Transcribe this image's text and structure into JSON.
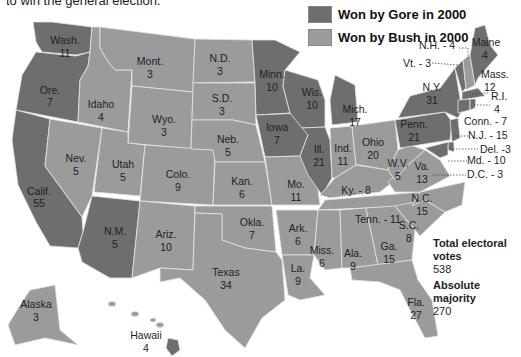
{
  "intro_text": "to win the general election.",
  "legend": {
    "items": [
      {
        "label": "Won by Gore in 2000",
        "color": "#6e6e6e"
      },
      {
        "label": "Won by Bush in 2000",
        "color": "#9b9b9b"
      }
    ]
  },
  "totals": {
    "total_label_line1": "Total electoral",
    "total_label_line2": "votes",
    "total_value": "538",
    "majority_label": "Absolute majority",
    "majority_value": "270"
  },
  "states": {
    "wash": {
      "name": "Wash.",
      "votes": "11",
      "winner": "Gore"
    },
    "ore": {
      "name": "Ore.",
      "votes": "7",
      "winner": "Gore"
    },
    "calif": {
      "name": "Calif.",
      "votes": "55",
      "winner": "Gore"
    },
    "idaho": {
      "name": "Idaho",
      "votes": "4",
      "winner": "Bush"
    },
    "nev": {
      "name": "Nev.",
      "votes": "5",
      "winner": "Bush"
    },
    "mont": {
      "name": "Mont.",
      "votes": "3",
      "winner": "Bush"
    },
    "wyo": {
      "name": "Wyo.",
      "votes": "3",
      "winner": "Bush"
    },
    "utah": {
      "name": "Utah",
      "votes": "5",
      "winner": "Bush"
    },
    "colo": {
      "name": "Colo.",
      "votes": "9",
      "winner": "Bush"
    },
    "nm": {
      "name": "N.M.",
      "votes": "5",
      "winner": "Gore"
    },
    "ariz": {
      "name": "Ariz.",
      "votes": "10",
      "winner": "Bush"
    },
    "nd": {
      "name": "N.D.",
      "votes": "3",
      "winner": "Bush"
    },
    "sd": {
      "name": "S.D.",
      "votes": "3",
      "winner": "Bush"
    },
    "neb": {
      "name": "Neb.",
      "votes": "5",
      "winner": "Bush"
    },
    "kan": {
      "name": "Kan.",
      "votes": "6",
      "winner": "Bush"
    },
    "okla": {
      "name": "Okla.",
      "votes": "7",
      "winner": "Bush"
    },
    "texas": {
      "name": "Texas",
      "votes": "34",
      "winner": "Bush"
    },
    "minn": {
      "name": "Minn.",
      "votes": "10",
      "winner": "Gore"
    },
    "iowa": {
      "name": "Iowa",
      "votes": "7",
      "winner": "Gore"
    },
    "mo": {
      "name": "Mo.",
      "votes": "11",
      "winner": "Bush"
    },
    "ark": {
      "name": "Ark.",
      "votes": "6",
      "winner": "Bush"
    },
    "la": {
      "name": "La.",
      "votes": "9",
      "winner": "Bush"
    },
    "wis": {
      "name": "Wis.",
      "votes": "10",
      "winner": "Gore"
    },
    "ill": {
      "name": "Ill.",
      "votes": "21",
      "winner": "Gore"
    },
    "mich": {
      "name": "Mich.",
      "votes": "17",
      "winner": "Gore"
    },
    "ind": {
      "name": "Ind.",
      "votes": "11",
      "winner": "Bush"
    },
    "ohio": {
      "name": "Ohio",
      "votes": "20",
      "winner": "Bush"
    },
    "ky": {
      "name": "Ky. - 8",
      "votes": "8",
      "winner": "Bush"
    },
    "tenn": {
      "name": "Tenn. - 11",
      "votes": "11",
      "winner": "Bush"
    },
    "miss": {
      "name": "Miss.",
      "votes": "6",
      "winner": "Bush"
    },
    "ala": {
      "name": "Ala.",
      "votes": "9",
      "winner": "Bush"
    },
    "ga": {
      "name": "Ga.",
      "votes": "15",
      "winner": "Bush"
    },
    "fla": {
      "name": "Fla.",
      "votes": "27",
      "winner": "Bush"
    },
    "sc": {
      "name": "S.C.",
      "votes": "8",
      "winner": "Bush"
    },
    "nc": {
      "name": "N.C.",
      "votes": "15",
      "winner": "Bush"
    },
    "va": {
      "name": "Va.",
      "votes": "13",
      "winner": "Bush"
    },
    "wv": {
      "name": "W.V.",
      "votes": "5",
      "winner": "Bush"
    },
    "penn": {
      "name": "Penn.",
      "votes": "21",
      "winner": "Gore"
    },
    "ny": {
      "name": "N.Y.",
      "votes": "31",
      "winner": "Gore"
    },
    "maine": {
      "name": "Maine",
      "votes": "4",
      "winner": "Gore"
    },
    "nh": {
      "name": "N.H. - 4",
      "votes": "4",
      "winner": "Bush"
    },
    "vt": {
      "name": "Vt. - 3",
      "votes": "3",
      "winner": "Gore"
    },
    "mass": {
      "name": "Mass.",
      "votes": "12",
      "winner": "Gore"
    },
    "ri": {
      "name": "R.I.",
      "votes": "4",
      "winner": "Gore"
    },
    "conn": {
      "name": "Conn. - 7",
      "votes": "7",
      "winner": "Gore"
    },
    "nj": {
      "name": "N.J. - 15",
      "votes": "15",
      "winner": "Gore"
    },
    "del": {
      "name": "Del. -3",
      "votes": "3",
      "winner": "Gore"
    },
    "md": {
      "name": "Md. - 10",
      "votes": "10",
      "winner": "Gore"
    },
    "dc": {
      "name": "D.C. - 3",
      "votes": "3",
      "winner": "Gore"
    },
    "alaska": {
      "name": "Alaska",
      "votes": "3",
      "winner": "Bush"
    },
    "hawaii": {
      "name": "Hawaii",
      "votes": "4",
      "winner": "Gore"
    }
  }
}
